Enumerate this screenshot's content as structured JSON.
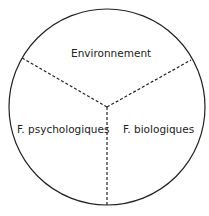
{
  "diagram": {
    "sectors": [
      {
        "label": "Environnement"
      },
      {
        "label": "F.  psychologiques"
      },
      {
        "label": "F.  biologiques"
      }
    ],
    "colors": {
      "stroke": "#222222",
      "background": "#ffffff"
    }
  }
}
